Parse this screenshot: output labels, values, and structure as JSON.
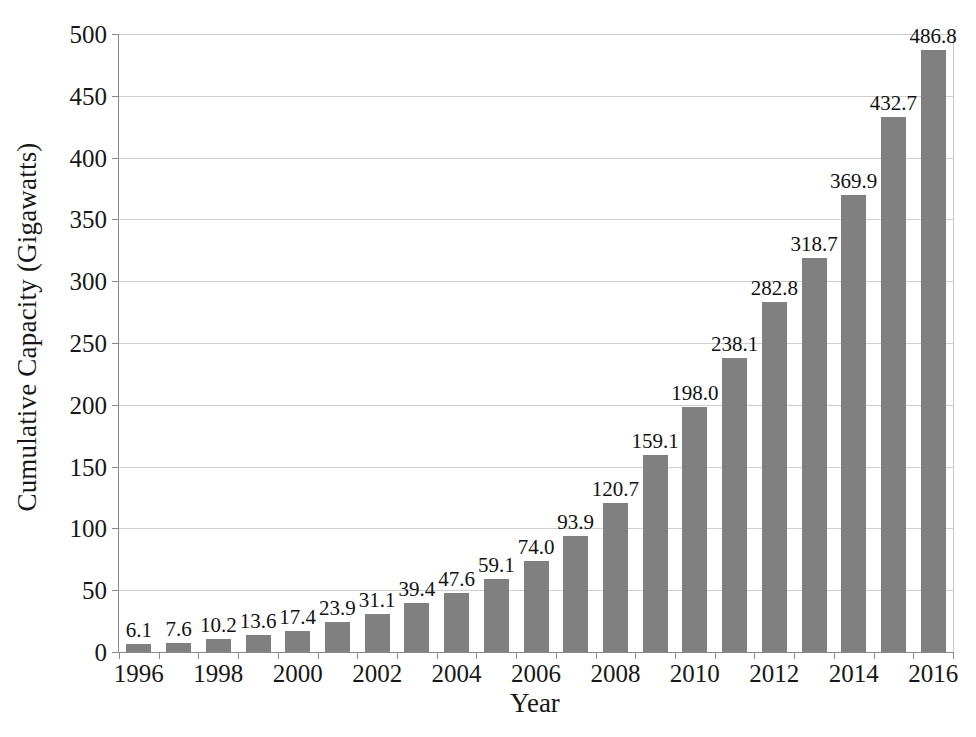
{
  "chart_data": {
    "type": "bar",
    "title": "",
    "xlabel": "Year",
    "ylabel": "Cumulative Capacity (Gigawatts)",
    "categories": [
      1996,
      1997,
      1998,
      1999,
      2000,
      2001,
      2002,
      2003,
      2004,
      2005,
      2006,
      2007,
      2008,
      2009,
      2010,
      2011,
      2012,
      2013,
      2014,
      2015,
      2016
    ],
    "values": [
      6.1,
      7.6,
      10.2,
      13.6,
      17.4,
      23.9,
      31.1,
      39.4,
      47.6,
      59.1,
      74.0,
      93.9,
      120.7,
      159.1,
      198.0,
      238.1,
      282.8,
      318.7,
      369.9,
      432.7,
      486.8
    ],
    "data_labels": [
      "6.1",
      "7.6",
      "10.2",
      "13.6",
      "17.4",
      "23.9",
      "31.1",
      "39.4",
      "47.6",
      "59.1",
      "74.0",
      "93.9",
      "120.7",
      "159.1",
      "198.0",
      "238.1",
      "282.8",
      "318.7",
      "369.9",
      "432.7",
      "486.8"
    ],
    "ylim": [
      0,
      500
    ],
    "ytick_values": [
      0,
      50,
      100,
      150,
      200,
      250,
      300,
      350,
      400,
      450,
      500
    ],
    "ytick_labels": [
      "0",
      "50",
      "100",
      "150",
      "200",
      "250",
      "300",
      "350",
      "400",
      "450",
      "500"
    ],
    "xtick_values": [
      1996,
      1998,
      2000,
      2002,
      2004,
      2006,
      2008,
      2010,
      2012,
      2014,
      2016
    ],
    "xtick_labels": [
      "1996",
      "1998",
      "2000",
      "2002",
      "2004",
      "2006",
      "2008",
      "2010",
      "2012",
      "2014",
      "2016"
    ],
    "grid": true,
    "legend": false,
    "bar_color": "#808080",
    "grid_color": "#cfcfcf",
    "axis_color": "#8a8a8a"
  }
}
